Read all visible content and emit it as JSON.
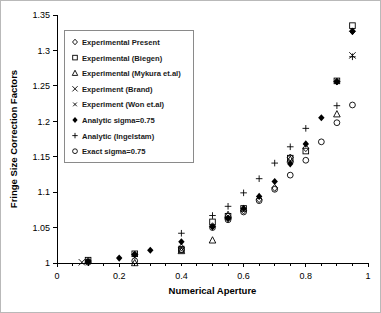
{
  "chart_data": {
    "type": "scatter",
    "title": "",
    "xlabel": "Numerical Aperture",
    "ylabel": "Fringe Size Correction Factors",
    "xlim": [
      0,
      1
    ],
    "ylim": [
      1,
      1.35
    ],
    "xticks": [
      "0",
      "0.2",
      "0.4",
      "0.6",
      "0.8",
      "1"
    ],
    "xtick_values": [
      0,
      0.2,
      0.4,
      0.6,
      0.8,
      1
    ],
    "xminor_step": 0.05,
    "yticks": [
      "1",
      "1.05",
      "1.1",
      "1.15",
      "1.2",
      "1.25",
      "1.3",
      "1.35"
    ],
    "ytick_values": [
      1,
      1.05,
      1.1,
      1.15,
      1.2,
      1.25,
      1.3,
      1.35
    ],
    "grid": false,
    "legend_position": "upper-left-inside",
    "series": [
      {
        "name": "Experimental Present",
        "marker": "diamond-open",
        "x": [
          0.1,
          0.25,
          0.4,
          0.5,
          0.55,
          0.6,
          0.65,
          0.7,
          0.75,
          0.8,
          0.9,
          0.95
        ],
        "y": [
          1.003,
          1.012,
          1.022,
          1.052,
          1.063,
          1.074,
          1.09,
          1.106,
          1.149,
          1.162,
          1.256,
          1.327
        ]
      },
      {
        "name": "Experimental (Biegen)",
        "marker": "square-open",
        "x": [
          0.1,
          0.25,
          0.4,
          0.5,
          0.55,
          0.6,
          0.75,
          0.8,
          0.9,
          0.95
        ],
        "y": [
          1.004,
          1.013,
          1.019,
          1.058,
          1.066,
          1.077,
          1.148,
          1.158,
          1.257,
          1.335
        ]
      },
      {
        "name": "Experimental (Mykura et.al)",
        "marker": "triangle-open",
        "x": [
          0.25,
          0.4,
          0.5,
          0.55,
          0.75,
          0.9
        ],
        "y": [
          1.0,
          1.017,
          1.032,
          1.068,
          1.146,
          1.21
        ]
      },
      {
        "name": "Experiment (Brand)",
        "marker": "x-large",
        "x": [
          0.08,
          0.95
        ],
        "y": [
          1.001,
          1.293
        ]
      },
      {
        "name": "Experiment (Won et.al)",
        "marker": "x-small",
        "x": [
          0.1,
          0.4
        ],
        "y": [
          1.002,
          1.021
        ]
      },
      {
        "name": "Analytic sigma=0.75",
        "marker": "diamond-filled",
        "x": [
          0.1,
          0.2,
          0.25,
          0.3,
          0.4,
          0.5,
          0.55,
          0.6,
          0.65,
          0.7,
          0.75,
          0.8,
          0.85,
          0.9,
          0.95
        ],
        "y": [
          1.002,
          1.007,
          1.012,
          1.018,
          1.03,
          1.051,
          1.063,
          1.077,
          1.094,
          1.115,
          1.14,
          1.168,
          1.205,
          1.256,
          1.327
        ]
      },
      {
        "name": "Analytic (Ingelstam)",
        "marker": "plus",
        "x": [
          0.4,
          0.5,
          0.55,
          0.6,
          0.65,
          0.7,
          0.75,
          0.8,
          0.9,
          0.95
        ],
        "y": [
          1.042,
          1.067,
          1.08,
          1.099,
          1.119,
          1.141,
          1.164,
          1.19,
          1.222,
          1.291
        ]
      },
      {
        "name": "Exact sigma=0.75",
        "marker": "circle-open",
        "x": [
          0.1,
          0.25,
          0.4,
          0.5,
          0.55,
          0.6,
          0.65,
          0.7,
          0.75,
          0.8,
          0.85,
          0.9,
          0.95
        ],
        "y": [
          1.001,
          1.003,
          1.019,
          1.05,
          1.061,
          1.072,
          1.088,
          1.104,
          1.124,
          1.145,
          1.171,
          1.198,
          1.223
        ]
      }
    ],
    "legend_entries": [
      {
        "label": "Experimental Present",
        "marker": "diamond-open"
      },
      {
        "label": "Experimental (Biegen)",
        "marker": "square-open"
      },
      {
        "label": "Experimental (Mykura et.al)",
        "marker": "triangle-open"
      },
      {
        "label": "Experiment (Brand)",
        "marker": "x-large"
      },
      {
        "label": "Experiment (Won et.al)",
        "marker": "x-small"
      },
      {
        "label": "Analytic sigma=0.75",
        "marker": "diamond-filled"
      },
      {
        "label": "Analytic (Ingelstam)",
        "marker": "plus"
      },
      {
        "label": "Exact sigma=0.75",
        "marker": "circle-open"
      }
    ]
  },
  "colors": {
    "frame": "#b9b9b9",
    "axis": "#000000",
    "marker": "#000000",
    "legend_border": "#8a8a8a",
    "background": "#ffffff"
  }
}
